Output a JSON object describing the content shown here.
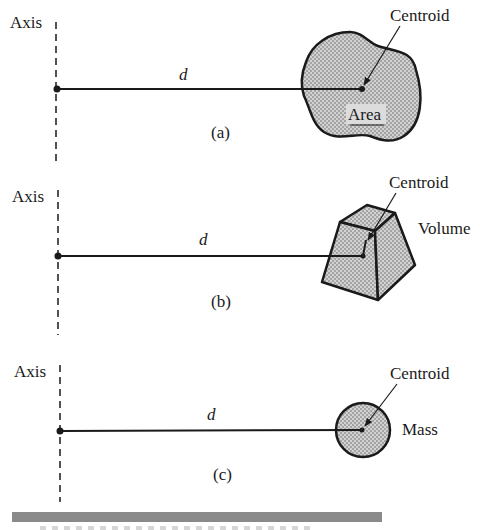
{
  "figure": {
    "panels": [
      {
        "id": "a",
        "axis_label": "Axis",
        "distance_label": "d",
        "panel_label": "(a)",
        "centroid_label": "Centroid",
        "shape_label": "Area",
        "shape": "irregular-area"
      },
      {
        "id": "b",
        "axis_label": "Axis",
        "distance_label": "d",
        "panel_label": "(b)",
        "centroid_label": "Centroid",
        "shape_label": "Volume",
        "shape": "frustum-volume"
      },
      {
        "id": "c",
        "axis_label": "Axis",
        "distance_label": "d",
        "panel_label": "(c)",
        "centroid_label": "Centroid",
        "shape_label": "Mass",
        "shape": "circle-mass"
      }
    ],
    "colors": {
      "ink": "#1a1a1a",
      "fill": "#c8c8c8",
      "bar": "#8a8a8a"
    }
  }
}
